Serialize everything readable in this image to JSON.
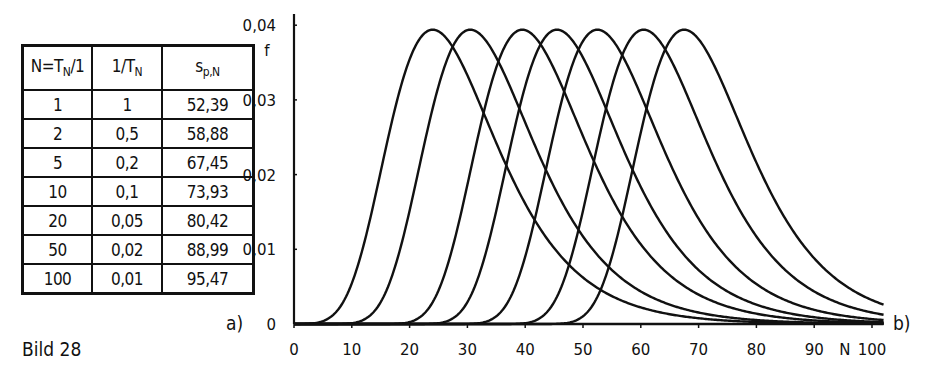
{
  "figure": {
    "caption": "Bild 28",
    "panel_a_label": "a)",
    "panel_b_label": "b)"
  },
  "table": {
    "headers": [
      "N=T_N/1",
      "1/T_N",
      "s_p,N"
    ],
    "header_display": {
      "c1_main": "N=T",
      "c1_sub": "N",
      "c1_tail": "/1",
      "c2_main": "1/T",
      "c2_sub": "N",
      "c3_main": "s",
      "c3_sub": "p,N"
    },
    "rows": [
      {
        "n": "1",
        "inv_t": "1",
        "s": "52,39"
      },
      {
        "n": "2",
        "inv_t": "0,5",
        "s": "58,88"
      },
      {
        "n": "5",
        "inv_t": "0,2",
        "s": "67,45"
      },
      {
        "n": "10",
        "inv_t": "0,1",
        "s": "73,93"
      },
      {
        "n": "20",
        "inv_t": "0,05",
        "s": "80,42"
      },
      {
        "n": "50",
        "inv_t": "0,02",
        "s": "88,99"
      },
      {
        "n": "100",
        "inv_t": "0,01",
        "s": "95,47"
      }
    ]
  },
  "chart_data": {
    "type": "line",
    "title": "",
    "xlabel": "N",
    "ylabel": "f",
    "xlim": [
      0,
      102
    ],
    "ylim": [
      0,
      0.04
    ],
    "grid": false,
    "legend": "none",
    "x_ticks": [
      "0",
      "10",
      "20",
      "30",
      "40",
      "50",
      "60",
      "70",
      "80",
      "90",
      "100"
    ],
    "y_ticks": [
      "0",
      "0,01",
      "0,02",
      "0,03",
      "0,04"
    ],
    "series_shape": "right-skewed unimodal density curves (extreme-value type), identical shape shifted along N",
    "peak_value": 0.0394,
    "series": [
      {
        "name": "curve-1",
        "mode_N": 24
      },
      {
        "name": "curve-2",
        "mode_N": 30.5
      },
      {
        "name": "curve-3",
        "mode_N": 39.5
      },
      {
        "name": "curve-4",
        "mode_N": 45.5
      },
      {
        "name": "curve-5",
        "mode_N": 52.5
      },
      {
        "name": "curve-6",
        "mode_N": 60.5
      },
      {
        "name": "curve-7",
        "mode_N": 67.5
      }
    ]
  },
  "colors": {
    "ink": "#111111",
    "background": "#ffffff"
  }
}
